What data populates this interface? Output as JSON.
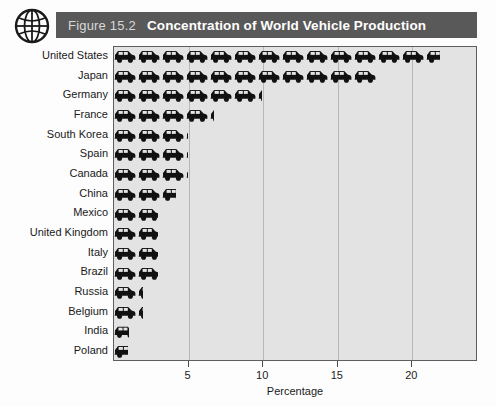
{
  "header": {
    "figure_number": "Figure 15.2",
    "title": "Concentration of World Vehicle Production",
    "globe_icon": "globe-icon",
    "bar_color": "#595959",
    "figure_number_color": "#d8d8d8",
    "title_color": "#ffffff"
  },
  "chart_data": {
    "type": "bar",
    "orientation": "horizontal",
    "title": "Concentration of World Vehicle Production",
    "xlabel": "Percentage",
    "ylabel": "",
    "xlim": [
      0,
      24.4
    ],
    "ylim": null,
    "grid": true,
    "grid_axis": "x",
    "legend": false,
    "marker_style": "car-pictograph",
    "xticks": [
      5,
      10,
      15,
      20
    ],
    "xtick_labels": [
      "5",
      "10",
      "15",
      "20"
    ],
    "categories": [
      "United States",
      "Japan",
      "Germany",
      "France",
      "South Korea",
      "Spain",
      "Canada",
      "China",
      "Mexico",
      "United Kingdom",
      "Italy",
      "Brazil",
      "Russia",
      "Belgium",
      "India",
      "Poland"
    ],
    "values": [
      21.9,
      17.7,
      10.0,
      6.8,
      5.0,
      5.0,
      5.0,
      4.2,
      3.0,
      3.0,
      3.0,
      3.0,
      2.0,
      2.0,
      1.1,
      1.0
    ],
    "value_unit": "%",
    "bar_color": "#111111",
    "plot_background": "#e3e3e3",
    "gridline_color": "#b7b7b7"
  },
  "axis": {
    "x_title": "Percentage"
  }
}
